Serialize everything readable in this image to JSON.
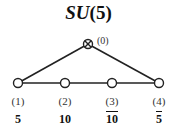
{
  "title": {
    "group": "SU",
    "open": "(",
    "rank": "5",
    "close": ")"
  },
  "extended_node": {
    "label": "(0)",
    "icon": "otimes-node-icon"
  },
  "nodes": [
    {
      "index": "(1)",
      "representation": "5",
      "conjugate": false
    },
    {
      "index": "(2)",
      "representation": "10",
      "conjugate": false
    },
    {
      "index": "(3)",
      "representation": "10",
      "conjugate": true
    },
    {
      "index": "(4)",
      "representation": "5",
      "conjugate": true
    }
  ],
  "colors": {
    "line": "#222222",
    "node_fill": "#ffffff"
  }
}
